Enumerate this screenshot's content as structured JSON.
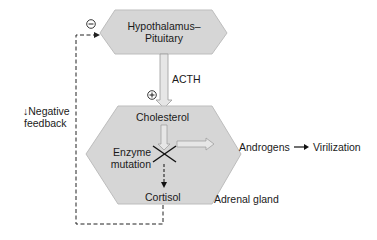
{
  "diagram": {
    "nodes": {
      "hypothalamus": {
        "line1": "Hypothalamus–",
        "line2": "Pituitary"
      },
      "adrenal": {
        "cholesterol": "Cholesterol",
        "enzyme_line1": "Enzyme",
        "enzyme_line2": "mutation",
        "cortisol": "Cortisol",
        "gland_label": "Adrenal gland"
      }
    },
    "edges": {
      "acth": "ACTH",
      "stimulate_sign": "+",
      "inhibit_sign": "−",
      "feedback_line1": "↓Negative",
      "feedback_line2": "feedback",
      "androgens": "Androgens",
      "virilization": "Virilization"
    },
    "colors": {
      "hex_fill": "#d6d6d6",
      "hex_stroke": "#b8b8b8",
      "arrow_fill": "#e4e4e4",
      "line": "#222222"
    }
  }
}
